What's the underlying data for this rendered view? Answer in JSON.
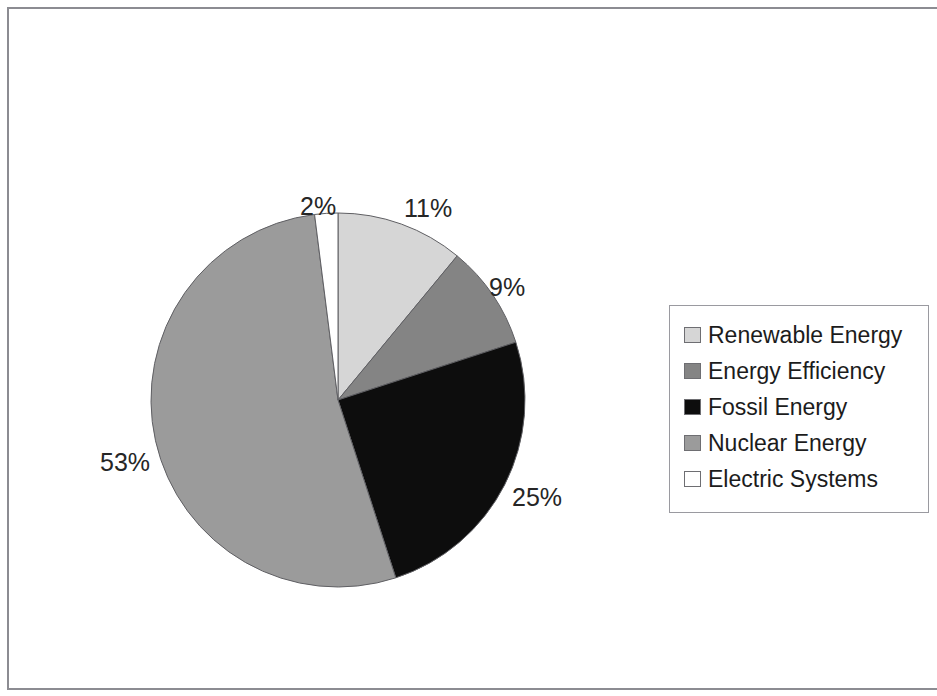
{
  "chart_data": {
    "type": "pie",
    "title": "",
    "subtitle": "",
    "xlabel": "",
    "ylabel": "",
    "legend_position": "right",
    "grid": false,
    "start_angle_deg": 0,
    "direction": "clockwise",
    "categories": [
      "Renewable Energy",
      "Energy Efficiency",
      "Fossil Energy",
      "Nuclear Energy",
      "Electric Systems"
    ],
    "values": [
      11,
      9,
      25,
      53,
      2
    ],
    "value_labels": [
      "11%",
      "9%",
      "25%",
      "53%",
      "2%"
    ],
    "colors": [
      "#d6d6d6",
      "#848484",
      "#0d0d0d",
      "#9b9b9b",
      "#ffffff"
    ],
    "slices": [
      {
        "label": "Renewable Energy",
        "value": 11,
        "display": "11%",
        "color": "#d6d6d6"
      },
      {
        "label": "Energy Efficiency",
        "value": 9,
        "display": "9%",
        "color": "#848484"
      },
      {
        "label": "Fossil Energy",
        "value": 25,
        "display": "25%",
        "color": "#0d0d0d"
      },
      {
        "label": "Nuclear Energy",
        "value": 53,
        "display": "53%",
        "color": "#9b9b9b"
      },
      {
        "label": "Electric Systems",
        "value": 2,
        "display": "2%",
        "color": "#ffffff"
      }
    ]
  },
  "labels": {
    "electric_systems": "2%",
    "renewable_energy": "11%",
    "energy_efficiency": "9%",
    "fossil_energy": "25%",
    "nuclear_energy": "53%"
  },
  "legend": {
    "items": [
      {
        "label": "Renewable Energy",
        "color": "#d6d6d6"
      },
      {
        "label": "Energy Efficiency",
        "color": "#848484"
      },
      {
        "label": "Fossil Energy",
        "color": "#0d0d0d"
      },
      {
        "label": "Nuclear Energy",
        "color": "#9b9b9b"
      },
      {
        "label": "Electric Systems",
        "color": "#ffffff"
      }
    ]
  },
  "style": {
    "background": "#ffffff",
    "frame_color": "#8c8c92",
    "legend_border": "#9a9aa0",
    "text_color": "#1c1c1c"
  }
}
